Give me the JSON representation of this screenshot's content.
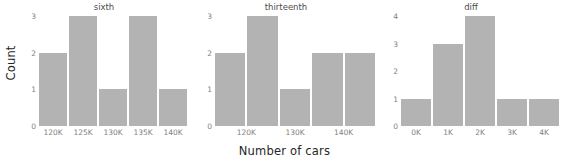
{
  "chart_data": {
    "type": "bar",
    "title": "",
    "xlabel": "Number of cars",
    "ylabel": "Count",
    "grid": false,
    "legend": "none",
    "bar_color": "#b3b3b3",
    "background": "#ffffff",
    "panels": [
      {
        "title": "sixth",
        "categories": [
          "120K",
          "125K",
          "130K",
          "135K",
          "140K"
        ],
        "values": [
          2,
          3,
          1,
          3,
          1
        ],
        "xticks": [
          "120K",
          "125K",
          "130K",
          "135K",
          "140K"
        ],
        "xtick_positions": [
          0.1,
          0.3,
          0.5,
          0.7,
          0.9
        ],
        "yticks": [
          "0",
          "1",
          "2",
          "3"
        ],
        "ylim": [
          0,
          3
        ]
      },
      {
        "title": "thirteenth",
        "categories": [
          "120K",
          "125K",
          "130K",
          "135K",
          "140K"
        ],
        "values": [
          2,
          3,
          1,
          2,
          2
        ],
        "xticks": [
          "120K",
          "130K",
          "140K"
        ],
        "xtick_positions": [
          0.2,
          0.5,
          0.8
        ],
        "yticks": [
          "0",
          "1",
          "2",
          "3"
        ],
        "ylim": [
          0,
          3
        ]
      },
      {
        "title": "diff",
        "categories": [
          "0K",
          "1K",
          "2K",
          "3K",
          "4K"
        ],
        "values": [
          1,
          3,
          4,
          1,
          1
        ],
        "xticks": [
          "0K",
          "1K",
          "2K",
          "3K",
          "4K"
        ],
        "xtick_positions": [
          0.1,
          0.3,
          0.5,
          0.7,
          0.9
        ],
        "yticks": [
          "0",
          "1",
          "2",
          "3",
          "4"
        ],
        "ylim": [
          0,
          4
        ]
      }
    ]
  }
}
